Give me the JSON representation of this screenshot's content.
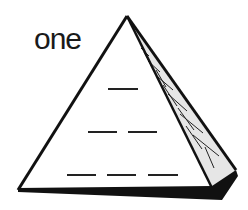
{
  "figure": {
    "label": "one",
    "shape": "pyramid",
    "rows": [
      {
        "row": 1,
        "blanks": 1
      },
      {
        "row": 2,
        "blanks": 2
      },
      {
        "row": 3,
        "blanks": 3
      }
    ],
    "colors": {
      "stroke": "#111111",
      "side_fill": "#e6e6e6",
      "base_shadow": "#111111",
      "background": "#ffffff"
    }
  }
}
